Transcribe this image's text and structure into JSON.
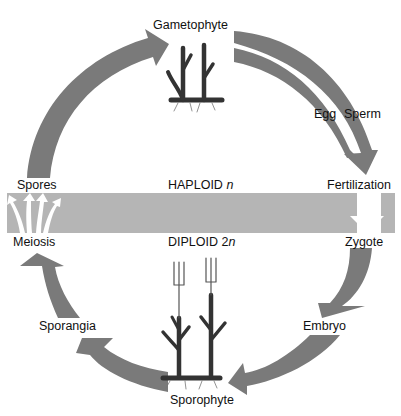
{
  "colors": {
    "arrow": "#7a7a7a",
    "band": "#b5b5b5",
    "plant": "#3a3a3a",
    "text": "#111111",
    "background": "#ffffff"
  },
  "band": {
    "haploid_label": "HAPLOID",
    "haploid_symbol": "n",
    "diploid_label": "DIPLOID",
    "diploid_prefix": "2",
    "diploid_symbol": "n"
  },
  "stages": {
    "gametophyte": "Gametophyte",
    "egg": "Egg",
    "sperm": "Sperm",
    "fertilization": "Fertilization",
    "zygote": "Zygote",
    "embryo": "Embryo",
    "sporophyte": "Sporophyte",
    "sporangia": "Sporangia",
    "meiosis": "Meiosis",
    "spores": "Spores"
  },
  "icons": {
    "gametophyte_plant": "gametophyte-plant-icon",
    "sporophyte_plant": "sporophyte-plant-icon",
    "spores_burst": "spores-burst-icon",
    "fertilization_arrow": "down-arrow-icon"
  }
}
